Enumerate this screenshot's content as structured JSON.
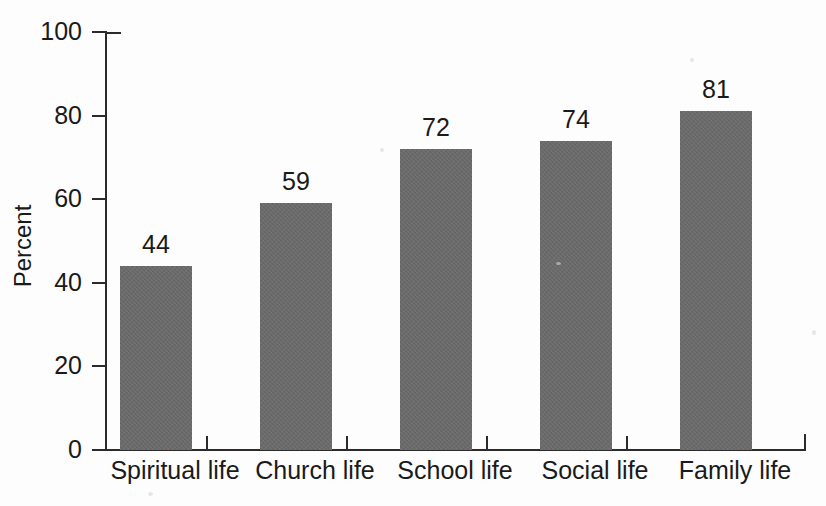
{
  "chart_data": {
    "type": "bar",
    "title": "",
    "subtitle": "",
    "xlabel": "",
    "ylabel": "Percent",
    "categories": [
      "Spiritual life",
      "Church life",
      "School life",
      "Social life",
      "Family life"
    ],
    "values": [
      44,
      59,
      72,
      74,
      81
    ],
    "value_labels": [
      "44",
      "59",
      "72",
      "74",
      "81"
    ],
    "ylim": [
      0,
      100
    ],
    "ytick_labels": [
      "100",
      "80",
      "60",
      "40",
      "20",
      "0"
    ],
    "ytick_values": [
      100,
      80,
      60,
      40,
      20,
      0
    ],
    "grid": false,
    "legend": false,
    "legend_position": "none",
    "bar_color": "#6a6a6a",
    "axis_color": "#2b2b2b",
    "text_color": "#1a1a1a",
    "background_color": "#fdfdfd",
    "annotations": []
  }
}
